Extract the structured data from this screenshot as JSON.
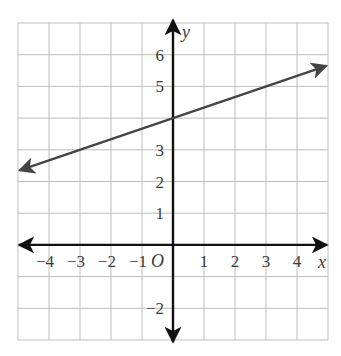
{
  "chart_data": {
    "type": "line",
    "title": "",
    "xlabel": "x",
    "ylabel": "y",
    "origin_label": "O",
    "xlim": [
      -5,
      5
    ],
    "ylim": [
      -3,
      7
    ],
    "grid": true,
    "x_ticks": [
      {
        "value": -4,
        "label": "−4"
      },
      {
        "value": -3,
        "label": "−3"
      },
      {
        "value": -2,
        "label": "−2"
      },
      {
        "value": -1,
        "label": "−1"
      },
      {
        "value": 1,
        "label": "1"
      },
      {
        "value": 2,
        "label": "2"
      },
      {
        "value": 3,
        "label": "3"
      },
      {
        "value": 4,
        "label": "4"
      }
    ],
    "y_ticks": [
      {
        "value": 6,
        "label": "6"
      },
      {
        "value": 5,
        "label": "5"
      },
      {
        "value": 3,
        "label": "3"
      },
      {
        "value": 2,
        "label": "2"
      },
      {
        "value": 1,
        "label": "1"
      },
      {
        "value": -2,
        "label": "−2"
      }
    ],
    "series": [
      {
        "name": "y = (1/3)x + 4",
        "slope": 0.3333,
        "intercept": 4,
        "x": [
          -4.95,
          0,
          4.95
        ],
        "y": [
          2.35,
          4,
          5.65
        ],
        "arrows_both_ends": true,
        "color": "#444444"
      }
    ]
  },
  "colors": {
    "grid": "#bdbdbd",
    "axis": "#111111",
    "line": "#444444"
  }
}
